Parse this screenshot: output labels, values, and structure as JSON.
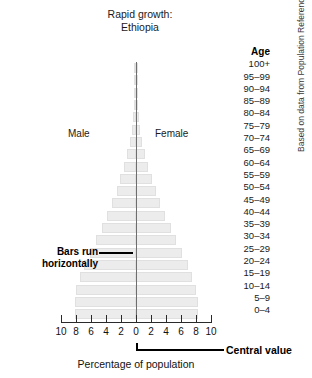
{
  "title": {
    "line1": "Rapid growth:",
    "line2": "Ethiopia"
  },
  "sex_labels": {
    "male": "Male",
    "female": "Female"
  },
  "age_header": "Age",
  "axis": {
    "title": "Percentage of population",
    "tick_labels": [
      "10",
      "8",
      "6",
      "4",
      "2",
      "0",
      "2",
      "4",
      "6",
      "8",
      "10"
    ]
  },
  "annotations": {
    "bars_run": "Bars run horizontally",
    "central_value": "Central value"
  },
  "source_credit": "Based on data from Population Reference Bureau.",
  "colors": {
    "bar_fill": "#ececec",
    "bar_stroke": "#e0e0e0",
    "axis": "#2a2a2a",
    "center_axis": "#6e6e6e",
    "text": "#111111"
  },
  "chart_data": {
    "type": "bar",
    "subtype": "population-pyramid",
    "title": "Rapid growth: Ethiopia",
    "xlabel": "Percentage of population",
    "ylabel": "Age",
    "xlim": [
      -10,
      10
    ],
    "xticks": [
      -10,
      -8,
      -6,
      -4,
      -2,
      0,
      2,
      4,
      6,
      8,
      10
    ],
    "xtick_labels": [
      "10",
      "8",
      "6",
      "4",
      "2",
      "0",
      "2",
      "4",
      "6",
      "8",
      "10"
    ],
    "grid": false,
    "legend": [
      "Male",
      "Female"
    ],
    "legend_position": "inside-upper",
    "categories": [
      "100+",
      "95–99",
      "90–94",
      "85–89",
      "80–84",
      "75–79",
      "70–74",
      "65–69",
      "60–64",
      "55–59",
      "50–54",
      "45–49",
      "40–44",
      "35–39",
      "30–34",
      "25–29",
      "20–24",
      "15–19",
      "10–14",
      "5–9",
      "0–4"
    ],
    "series": [
      {
        "name": "Male",
        "side": "left",
        "values": [
          0.02,
          0.05,
          0.1,
          0.2,
          0.35,
          0.55,
          0.85,
          1.2,
          1.6,
          2.1,
          2.6,
          3.2,
          3.9,
          4.6,
          5.3,
          6.1,
          6.9,
          7.5,
          8.0,
          8.2,
          8.2
        ]
      },
      {
        "name": "Female",
        "side": "right",
        "values": [
          0.02,
          0.05,
          0.1,
          0.2,
          0.35,
          0.55,
          0.85,
          1.2,
          1.6,
          2.1,
          2.6,
          3.2,
          3.9,
          4.6,
          5.3,
          6.1,
          6.9,
          7.5,
          8.0,
          8.2,
          8.2
        ]
      }
    ]
  },
  "layout": {
    "plot_top": 62,
    "row_height": 12.3,
    "bar_height": 10,
    "center_x": 136,
    "px_per_unit": 7.5
  }
}
